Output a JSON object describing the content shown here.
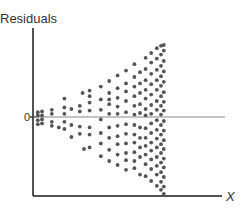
{
  "chart_data": {
    "type": "scatter",
    "title": "",
    "ylabel": "Residuals",
    "xlabel": "X",
    "y_tick_labels": [
      "0"
    ],
    "xlim": [
      0,
      10
    ],
    "ylim": [
      -10,
      10
    ],
    "reference_line": {
      "y": 0
    },
    "grid": false,
    "legend": "none",
    "pattern": "fan-shaped (heteroscedastic): residual spread increases with X",
    "points": [
      {
        "x": 0.2,
        "y": 0.6
      },
      {
        "x": 0.2,
        "y": 0.2
      },
      {
        "x": 0.2,
        "y": -0.4
      },
      {
        "x": 0.2,
        "y": -0.9
      },
      {
        "x": 0.5,
        "y": 0.7
      },
      {
        "x": 0.5,
        "y": 0.2
      },
      {
        "x": 0.5,
        "y": -0.3
      },
      {
        "x": 0.5,
        "y": -0.8
      },
      {
        "x": 1.2,
        "y": 0.9
      },
      {
        "x": 1.2,
        "y": 0.4
      },
      {
        "x": 1.2,
        "y": -0.6
      },
      {
        "x": 1.2,
        "y": -1.1
      },
      {
        "x": 1.7,
        "y": -1.3
      },
      {
        "x": 2.1,
        "y": 2.3
      },
      {
        "x": 2.1,
        "y": 1.2
      },
      {
        "x": 2.1,
        "y": 0.4
      },
      {
        "x": 2.1,
        "y": -0.6
      },
      {
        "x": 2.1,
        "y": -1.5
      },
      {
        "x": 2.6,
        "y": 1.0
      },
      {
        "x": 2.6,
        "y": -1.0
      },
      {
        "x": 2.6,
        "y": -2.5
      },
      {
        "x": 3.2,
        "y": 1.4
      },
      {
        "x": 3.2,
        "y": 0.7
      },
      {
        "x": 3.2,
        "y": -1.2
      },
      {
        "x": 3.2,
        "y": -2.1
      },
      {
        "x": 3.4,
        "y": 3.0
      },
      {
        "x": 3.5,
        "y": -4.0
      },
      {
        "x": 3.9,
        "y": 3.3
      },
      {
        "x": 3.9,
        "y": 2.6
      },
      {
        "x": 3.9,
        "y": 1.8
      },
      {
        "x": 3.9,
        "y": 0.8
      },
      {
        "x": 3.9,
        "y": -1.3
      },
      {
        "x": 3.9,
        "y": -2.2
      },
      {
        "x": 3.9,
        "y": -3.8
      },
      {
        "x": 4.7,
        "y": 3.8
      },
      {
        "x": 4.7,
        "y": 2.2
      },
      {
        "x": 4.7,
        "y": 0.9
      },
      {
        "x": 4.7,
        "y": -0.3
      },
      {
        "x": 4.7,
        "y": -2.0
      },
      {
        "x": 4.7,
        "y": -3.3
      },
      {
        "x": 4.7,
        "y": -4.9
      },
      {
        "x": 5.3,
        "y": 4.5
      },
      {
        "x": 5.3,
        "y": 3.0
      },
      {
        "x": 5.3,
        "y": 2.2
      },
      {
        "x": 5.3,
        "y": 1.6
      },
      {
        "x": 5.3,
        "y": 0.4
      },
      {
        "x": 5.3,
        "y": -1.3
      },
      {
        "x": 5.3,
        "y": -2.6
      },
      {
        "x": 5.3,
        "y": -4.1
      },
      {
        "x": 5.3,
        "y": -5.5
      },
      {
        "x": 5.9,
        "y": 5.2
      },
      {
        "x": 5.9,
        "y": 3.6
      },
      {
        "x": 5.9,
        "y": 2.4
      },
      {
        "x": 5.9,
        "y": 1.3
      },
      {
        "x": 5.9,
        "y": 0.4
      },
      {
        "x": 5.9,
        "y": -1.1
      },
      {
        "x": 5.9,
        "y": -2.4
      },
      {
        "x": 5.9,
        "y": -3.4
      },
      {
        "x": 5.9,
        "y": -4.7
      },
      {
        "x": 5.9,
        "y": -6.0
      },
      {
        "x": 6.5,
        "y": 5.8
      },
      {
        "x": 6.5,
        "y": 4.2
      },
      {
        "x": 6.5,
        "y": 3.2
      },
      {
        "x": 6.5,
        "y": 2.0
      },
      {
        "x": 6.5,
        "y": 0.6
      },
      {
        "x": 6.5,
        "y": -0.9
      },
      {
        "x": 6.5,
        "y": -2.1
      },
      {
        "x": 6.5,
        "y": -3.3
      },
      {
        "x": 6.5,
        "y": -4.5
      },
      {
        "x": 6.5,
        "y": -5.4
      },
      {
        "x": 6.5,
        "y": -6.6
      },
      {
        "x": 7.1,
        "y": 6.6
      },
      {
        "x": 7.1,
        "y": 5.0
      },
      {
        "x": 7.1,
        "y": 3.8
      },
      {
        "x": 7.1,
        "y": 2.6
      },
      {
        "x": 7.1,
        "y": 1.4
      },
      {
        "x": 7.1,
        "y": 0.3
      },
      {
        "x": 7.1,
        "y": -1.0
      },
      {
        "x": 7.1,
        "y": -2.2
      },
      {
        "x": 7.1,
        "y": -3.2
      },
      {
        "x": 7.1,
        "y": -4.4
      },
      {
        "x": 7.1,
        "y": -5.5
      },
      {
        "x": 7.1,
        "y": -6.4
      },
      {
        "x": 7.5,
        "y": 5.6
      },
      {
        "x": 7.5,
        "y": 4.2
      },
      {
        "x": 7.5,
        "y": 3.0
      },
      {
        "x": 7.5,
        "y": 1.6
      },
      {
        "x": 7.5,
        "y": 0.5
      },
      {
        "x": 7.5,
        "y": -1.3
      },
      {
        "x": 7.5,
        "y": -2.6
      },
      {
        "x": 7.5,
        "y": -3.8
      },
      {
        "x": 7.5,
        "y": -5.0
      },
      {
        "x": 7.5,
        "y": -7.2
      },
      {
        "x": 7.9,
        "y": 7.4
      },
      {
        "x": 7.9,
        "y": 6.0
      },
      {
        "x": 7.9,
        "y": 4.6
      },
      {
        "x": 7.9,
        "y": 3.4
      },
      {
        "x": 7.9,
        "y": 2.3
      },
      {
        "x": 7.9,
        "y": 1.0
      },
      {
        "x": 7.9,
        "y": 0.2
      },
      {
        "x": 7.9,
        "y": -1.4
      },
      {
        "x": 7.9,
        "y": -2.6
      },
      {
        "x": 7.9,
        "y": -3.6
      },
      {
        "x": 7.9,
        "y": -4.7
      },
      {
        "x": 7.9,
        "y": -5.9
      },
      {
        "x": 7.9,
        "y": -7.4
      },
      {
        "x": 8.3,
        "y": 8.0
      },
      {
        "x": 8.3,
        "y": 6.8
      },
      {
        "x": 8.3,
        "y": 5.4
      },
      {
        "x": 8.3,
        "y": 4.1
      },
      {
        "x": 8.3,
        "y": 2.8
      },
      {
        "x": 8.3,
        "y": 1.5
      },
      {
        "x": 8.3,
        "y": 0.4
      },
      {
        "x": 8.3,
        "y": -0.8
      },
      {
        "x": 8.3,
        "y": -2.0
      },
      {
        "x": 8.3,
        "y": -3.2
      },
      {
        "x": 8.3,
        "y": -4.2
      },
      {
        "x": 8.3,
        "y": -5.3
      },
      {
        "x": 8.3,
        "y": -6.5
      },
      {
        "x": 8.3,
        "y": -8.0
      },
      {
        "x": 8.7,
        "y": 8.6
      },
      {
        "x": 8.7,
        "y": 7.3
      },
      {
        "x": 8.7,
        "y": 5.9
      },
      {
        "x": 8.7,
        "y": 4.6
      },
      {
        "x": 8.7,
        "y": 3.4
      },
      {
        "x": 8.7,
        "y": 2.0
      },
      {
        "x": 8.7,
        "y": 0.9
      },
      {
        "x": 8.7,
        "y": -0.4
      },
      {
        "x": 8.7,
        "y": -1.6
      },
      {
        "x": 8.7,
        "y": -2.7
      },
      {
        "x": 8.7,
        "y": -3.8
      },
      {
        "x": 8.7,
        "y": -5.0
      },
      {
        "x": 8.7,
        "y": -6.1
      },
      {
        "x": 8.7,
        "y": -7.2
      },
      {
        "x": 8.7,
        "y": -8.6
      },
      {
        "x": 9.0,
        "y": 8.9
      },
      {
        "x": 9.0,
        "y": 7.8
      },
      {
        "x": 9.0,
        "y": 6.4
      },
      {
        "x": 9.0,
        "y": 5.1
      },
      {
        "x": 9.0,
        "y": 3.9
      },
      {
        "x": 9.0,
        "y": 2.6
      },
      {
        "x": 9.0,
        "y": 1.4
      },
      {
        "x": 9.0,
        "y": 0.3
      },
      {
        "x": 9.0,
        "y": -1.0
      },
      {
        "x": 9.0,
        "y": -2.2
      },
      {
        "x": 9.0,
        "y": -3.4
      },
      {
        "x": 9.0,
        "y": -4.5
      },
      {
        "x": 9.0,
        "y": -5.7
      },
      {
        "x": 9.0,
        "y": -6.9
      },
      {
        "x": 9.0,
        "y": -8.1
      },
      {
        "x": 9.0,
        "y": -9.1
      },
      {
        "x": 9.2,
        "y": 9.0
      },
      {
        "x": 9.2,
        "y": 8.3
      },
      {
        "x": 9.2,
        "y": 7.0
      },
      {
        "x": 9.2,
        "y": 5.7
      },
      {
        "x": 9.2,
        "y": 4.4
      },
      {
        "x": 9.2,
        "y": 3.1
      },
      {
        "x": 9.2,
        "y": 1.9
      },
      {
        "x": 9.2,
        "y": 0.8
      },
      {
        "x": 9.2,
        "y": -0.5
      },
      {
        "x": 9.2,
        "y": -1.7
      },
      {
        "x": 9.2,
        "y": -2.9
      },
      {
        "x": 9.2,
        "y": -4.0
      },
      {
        "x": 9.2,
        "y": -5.2
      },
      {
        "x": 9.2,
        "y": -6.3
      },
      {
        "x": 9.2,
        "y": -7.5
      },
      {
        "x": 9.2,
        "y": -8.7
      },
      {
        "x": 9.2,
        "y": -9.6
      }
    ]
  },
  "colors": {
    "axis": "#1a1a1a",
    "zero_line": "#888888",
    "point": "#555555",
    "text": "#333333"
  }
}
